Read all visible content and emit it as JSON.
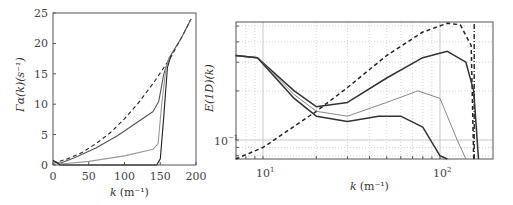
{
  "chart_data": [
    {
      "type": "line",
      "title": "",
      "xlabel": "k (m⁻¹)",
      "ylabel": "Γα(k)(s⁻¹)",
      "xlim": [
        0,
        200
      ],
      "ylim": [
        0,
        25
      ],
      "xticks": [
        0,
        50,
        100,
        150,
        200
      ],
      "yticks": [
        0,
        5,
        10,
        15,
        20,
        25
      ],
      "grid": false,
      "series": [
        {
          "name": "dashed",
          "style": "dashed",
          "color": "#222222",
          "x": [
            0,
            20,
            40,
            60,
            80,
            100,
            120,
            140,
            155,
            165,
            180,
            193
          ],
          "y": [
            0.3,
            1.0,
            2.0,
            3.5,
            5.3,
            7.6,
            10.3,
            13.4,
            16.0,
            17.8,
            21.0,
            24.0
          ]
        },
        {
          "name": "solid-dark-gray",
          "style": "solid",
          "color": "#555555",
          "x": [
            0,
            10,
            30,
            60,
            90,
            120,
            140,
            148,
            155,
            162,
            180,
            193
          ],
          "y": [
            0.6,
            0.3,
            1.2,
            2.8,
            4.8,
            7.2,
            8.8,
            10.5,
            15.0,
            17.5,
            21.0,
            24.0
          ]
        },
        {
          "name": "solid-light-gray",
          "style": "solid",
          "color": "#999999",
          "x": [
            0,
            15,
            50,
            100,
            140,
            147,
            152,
            158,
            163
          ],
          "y": [
            0.4,
            0.2,
            0.6,
            1.5,
            2.6,
            3.5,
            10.0,
            16.0,
            17.8
          ]
        },
        {
          "name": "solid-black",
          "style": "solid",
          "color": "#222222",
          "x": [
            0,
            10,
            145,
            150,
            155,
            160,
            165
          ],
          "y": [
            0.8,
            0.0,
            0.0,
            1.0,
            8.0,
            16.0,
            18.0
          ]
        }
      ]
    },
    {
      "type": "line",
      "title": "",
      "xlabel": "k (m⁻¹)",
      "ylabel": "E^(1D)(k)",
      "xscale": "log",
      "yscale": "log",
      "xlim": [
        7,
        200
      ],
      "ylim": [
        0.066,
        0.9
      ],
      "xticks": [
        "10^1",
        "10^2"
      ],
      "yticks": [
        "10^-1"
      ],
      "grid": true,
      "series": [
        {
          "name": "dashed",
          "style": "dashed",
          "color": "#222222",
          "x": [
            7,
            10,
            20,
            30,
            50,
            80,
            110,
            130,
            150,
            155
          ],
          "y": [
            0.066,
            0.09,
            0.15,
            0.21,
            0.33,
            0.46,
            0.52,
            0.51,
            0.38,
            0.066
          ]
        },
        {
          "name": "solid-dark",
          "style": "solid",
          "color": "#333333",
          "x": [
            7,
            9.3,
            15,
            20,
            30,
            50,
            80,
            110,
            140,
            155,
            165
          ],
          "y": [
            0.33,
            0.32,
            0.2,
            0.16,
            0.17,
            0.24,
            0.32,
            0.35,
            0.3,
            0.2,
            0.066
          ]
        },
        {
          "name": "solid-gray",
          "style": "solid",
          "color": "#888888",
          "x": [
            7,
            9.3,
            15,
            20,
            30,
            50,
            75,
            100,
            125,
            140
          ],
          "y": [
            0.33,
            0.32,
            0.19,
            0.15,
            0.14,
            0.17,
            0.2,
            0.18,
            0.1,
            0.066
          ]
        },
        {
          "name": "solid-black-low",
          "style": "solid",
          "color": "#333333",
          "x": [
            7,
            9.3,
            15,
            20,
            30,
            45,
            60,
            80,
            100,
            110
          ],
          "y": [
            0.33,
            0.32,
            0.18,
            0.14,
            0.13,
            0.14,
            0.14,
            0.12,
            0.08,
            0.066
          ]
        },
        {
          "name": "cutoff-dashdot",
          "style": "dashdot",
          "color": "#333333",
          "x": [
            156,
            156
          ],
          "y": [
            0.066,
            0.9
          ]
        }
      ]
    }
  ],
  "left": {
    "xlabel_k": "k",
    "xlabel_unit": "(m⁻¹)",
    "ylabel": "Γα(k)(s⁻¹)",
    "xticks": [
      "0",
      "50",
      "100",
      "150",
      "200"
    ],
    "yticks": [
      "0",
      "5",
      "10",
      "15",
      "20",
      "25"
    ]
  },
  "right": {
    "xlabel_k": "k",
    "xlabel_unit": "(m⁻¹)",
    "ylabel": "E(1D)(k)",
    "xtick1": "10",
    "xtick1_exp": "1",
    "xtick2": "10",
    "xtick2_exp": "2",
    "ytick": "10",
    "ytick_exp": "−1"
  }
}
